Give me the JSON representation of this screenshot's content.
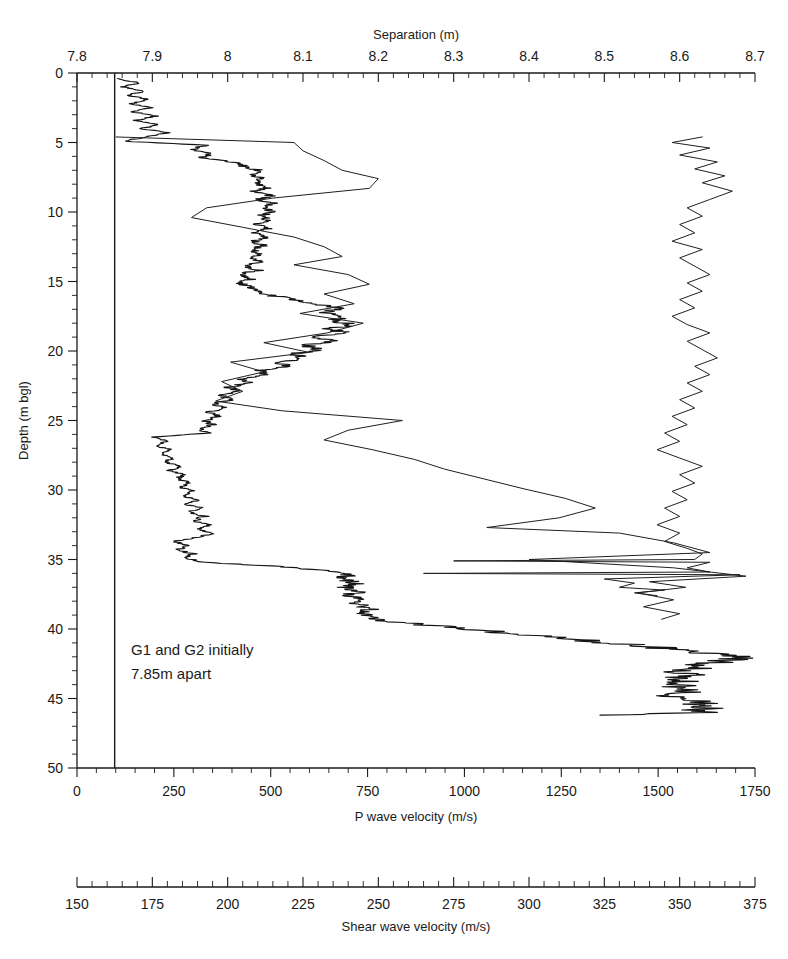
{
  "figure": {
    "background": "#ffffff",
    "ink": "#1a1a1a"
  },
  "annotation": {
    "line1": "G1 and G2 initially",
    "line2": "7.85m apart"
  },
  "chart_data": {
    "type": "line",
    "title": "",
    "orientation": "vertical-depth-profile",
    "grid": false,
    "legend": "none",
    "yaxis": {
      "label": "Depth (m bgl)",
      "min": 0,
      "max": 50,
      "inverted": true,
      "ticks": [
        0,
        5,
        10,
        15,
        20,
        25,
        30,
        35,
        40,
        45,
        50
      ],
      "tick_labels": [
        "0",
        "5",
        "10",
        "15",
        "20",
        "25",
        "30",
        "35",
        "40",
        "45",
        "50"
      ],
      "minor_interval": 1
    },
    "xaxis_top": {
      "label": "Separation (m)",
      "min": 7.8,
      "max": 8.7,
      "ticks": [
        7.8,
        7.9,
        8.0,
        8.1,
        8.2,
        8.3,
        8.4,
        8.5,
        8.6,
        8.7
      ],
      "tick_labels": [
        "7.8",
        "7.9",
        "8",
        "8.1",
        "8.2",
        "8.3",
        "8.4",
        "8.5",
        "8.6",
        "8.7"
      ],
      "minor_per_major": 5
    },
    "xaxis_bottom": {
      "label": "P wave velocity (m/s)",
      "min": 0,
      "max": 1750,
      "ticks": [
        0,
        250,
        500,
        750,
        1000,
        1250,
        1500,
        1750
      ],
      "tick_labels": [
        "0",
        "250",
        "500",
        "750",
        "1000",
        "1250",
        "1500",
        "1750"
      ],
      "minor_per_major": 5
    },
    "xaxis_shear": {
      "label": "Shear wave velocity (m/s)",
      "min": 150,
      "max": 375,
      "ticks": [
        150,
        175,
        200,
        225,
        250,
        275,
        300,
        325,
        350,
        375
      ],
      "tick_labels": [
        "150",
        "175",
        "200",
        "225",
        "250",
        "275",
        "300",
        "325",
        "350",
        "375"
      ],
      "minor_per_major": 5
    },
    "reference_line": {
      "name": "initial-separation",
      "axis": "xaxis_top",
      "value": 7.85,
      "depth_from": 0,
      "depth_to": 50
    },
    "series": [
      {
        "name": "P wave velocity",
        "axis": "xaxis_bottom",
        "style": "noisy",
        "points": [
          [
            0.4,
            105
          ],
          [
            0.7,
            160
          ],
          [
            1.0,
            120
          ],
          [
            1.3,
            175
          ],
          [
            1.6,
            130
          ],
          [
            1.9,
            185
          ],
          [
            2.2,
            140
          ],
          [
            2.5,
            190
          ],
          [
            2.8,
            145
          ],
          [
            3.1,
            205
          ],
          [
            3.4,
            150
          ],
          [
            3.7,
            215
          ],
          [
            4.0,
            165
          ],
          [
            4.3,
            235
          ],
          [
            4.6,
            180
          ],
          [
            4.9,
            120
          ],
          [
            5.2,
            330
          ],
          [
            5.5,
            300
          ],
          [
            5.8,
            345
          ],
          [
            6.1,
            320
          ],
          [
            6.4,
            400
          ],
          [
            6.7,
            430
          ],
          [
            7.0,
            470
          ],
          [
            7.3,
            445
          ],
          [
            7.6,
            480
          ],
          [
            7.9,
            455
          ],
          [
            8.2,
            495
          ],
          [
            8.5,
            460
          ],
          [
            8.8,
            500
          ],
          [
            9.1,
            470
          ],
          [
            9.4,
            510
          ],
          [
            9.7,
            475
          ],
          [
            10.0,
            505
          ],
          [
            10.3,
            470
          ],
          [
            10.6,
            500
          ],
          [
            10.9,
            460
          ],
          [
            11.2,
            495
          ],
          [
            11.5,
            455
          ],
          [
            11.8,
            490
          ],
          [
            12.1,
            450
          ],
          [
            12.4,
            485
          ],
          [
            12.7,
            445
          ],
          [
            13.0,
            480
          ],
          [
            13.3,
            440
          ],
          [
            13.6,
            470
          ],
          [
            13.9,
            430
          ],
          [
            14.2,
            465
          ],
          [
            14.5,
            425
          ],
          [
            14.8,
            455
          ],
          [
            15.1,
            415
          ],
          [
            15.4,
            450
          ],
          [
            15.7,
            470
          ],
          [
            16.0,
            500
          ],
          [
            16.3,
            560
          ],
          [
            16.6,
            610
          ],
          [
            16.9,
            680
          ],
          [
            17.2,
            640
          ],
          [
            17.5,
            700
          ],
          [
            17.8,
            660
          ],
          [
            18.1,
            710
          ],
          [
            18.4,
            655
          ],
          [
            18.7,
            690
          ],
          [
            19.0,
            620
          ],
          [
            19.3,
            660
          ],
          [
            19.6,
            590
          ],
          [
            19.9,
            630
          ],
          [
            20.2,
            560
          ],
          [
            20.5,
            590
          ],
          [
            20.8,
            520
          ],
          [
            21.1,
            545
          ],
          [
            21.4,
            470
          ],
          [
            21.7,
            495
          ],
          [
            22.0,
            420
          ],
          [
            22.3,
            445
          ],
          [
            22.6,
            390
          ],
          [
            22.9,
            415
          ],
          [
            23.2,
            370
          ],
          [
            23.5,
            395
          ],
          [
            23.8,
            355
          ],
          [
            24.1,
            380
          ],
          [
            24.4,
            340
          ],
          [
            24.7,
            365
          ],
          [
            25.0,
            330
          ],
          [
            25.3,
            350
          ],
          [
            25.6,
            315
          ],
          [
            25.9,
            340
          ],
          [
            26.2,
            200
          ],
          [
            26.5,
            230
          ],
          [
            26.8,
            205
          ],
          [
            27.1,
            240
          ],
          [
            27.4,
            215
          ],
          [
            27.7,
            250
          ],
          [
            28.0,
            225
          ],
          [
            28.3,
            265
          ],
          [
            28.6,
            240
          ],
          [
            28.9,
            280
          ],
          [
            29.2,
            255
          ],
          [
            29.5,
            295
          ],
          [
            29.8,
            265
          ],
          [
            30.1,
            300
          ],
          [
            30.4,
            275
          ],
          [
            30.7,
            310
          ],
          [
            31.0,
            280
          ],
          [
            31.3,
            320
          ],
          [
            31.6,
            290
          ],
          [
            31.9,
            330
          ],
          [
            32.2,
            300
          ],
          [
            32.5,
            340
          ],
          [
            32.8,
            310
          ],
          [
            33.1,
            350
          ],
          [
            33.4,
            315
          ],
          [
            33.7,
            250
          ],
          [
            34.0,
            285
          ],
          [
            34.3,
            260
          ],
          [
            34.6,
            300
          ],
          [
            34.9,
            275
          ],
          [
            35.2,
            330
          ],
          [
            35.5,
            520
          ],
          [
            35.8,
            640
          ],
          [
            36.1,
            700
          ],
          [
            36.4,
            680
          ],
          [
            36.7,
            720
          ],
          [
            37.0,
            690
          ],
          [
            37.3,
            730
          ],
          [
            37.6,
            700
          ],
          [
            37.9,
            745
          ],
          [
            38.2,
            715
          ],
          [
            38.5,
            760
          ],
          [
            38.8,
            735
          ],
          [
            39.1,
            770
          ],
          [
            39.4,
            790
          ],
          [
            39.7,
            900
          ],
          [
            40.0,
            1010
          ],
          [
            40.3,
            1120
          ],
          [
            40.6,
            1230
          ],
          [
            40.9,
            1340
          ],
          [
            41.2,
            1450
          ],
          [
            41.5,
            1560
          ],
          [
            41.8,
            1660
          ],
          [
            42.1,
            1710
          ],
          [
            42.4,
            1660
          ],
          [
            42.7,
            1600
          ],
          [
            43.0,
            1560
          ],
          [
            43.3,
            1590
          ],
          [
            43.6,
            1545
          ],
          [
            43.9,
            1580
          ],
          [
            44.2,
            1530
          ],
          [
            44.5,
            1575
          ],
          [
            44.8,
            1525
          ],
          [
            45.1,
            1570
          ],
          [
            45.4,
            1605
          ],
          [
            45.7,
            1630
          ],
          [
            46.0,
            1600
          ],
          [
            46.2,
            1350
          ]
        ]
      },
      {
        "name": "Shear wave velocity",
        "axis": "xaxis_shear",
        "style": "smooth",
        "points": [
          [
            4.6,
            163
          ],
          [
            5.0,
            222
          ],
          [
            5.6,
            225
          ],
          [
            6.3,
            232
          ],
          [
            7.0,
            238
          ],
          [
            7.6,
            250
          ],
          [
            8.3,
            247
          ],
          [
            9.0,
            215
          ],
          [
            9.7,
            193
          ],
          [
            10.4,
            188
          ],
          [
            11.1,
            205
          ],
          [
            11.8,
            222
          ],
          [
            12.5,
            232
          ],
          [
            13.2,
            238
          ],
          [
            13.8,
            222
          ],
          [
            14.5,
            240
          ],
          [
            15.2,
            247
          ],
          [
            15.9,
            232
          ],
          [
            16.6,
            242
          ],
          [
            17.3,
            224
          ],
          [
            18.0,
            245
          ],
          [
            18.7,
            233
          ],
          [
            19.4,
            212
          ],
          [
            20.1,
            227
          ],
          [
            20.8,
            201
          ],
          [
            21.5,
            212
          ],
          [
            22.2,
            198
          ],
          [
            22.9,
            205
          ],
          [
            23.6,
            196
          ],
          [
            24.3,
            218
          ],
          [
            25.0,
            258
          ],
          [
            25.7,
            240
          ],
          [
            26.4,
            232
          ],
          [
            27.1,
            248
          ],
          [
            27.8,
            262
          ],
          [
            28.5,
            272
          ],
          [
            29.2,
            285
          ],
          [
            29.9,
            298
          ],
          [
            30.6,
            312
          ],
          [
            31.3,
            322
          ],
          [
            32.0,
            310
          ],
          [
            32.7,
            286
          ],
          [
            33.1,
            330
          ],
          [
            33.8,
            348
          ],
          [
            34.5,
            360
          ],
          [
            35.0,
            300
          ],
          [
            35.6,
            348
          ],
          [
            36.2,
            372
          ],
          [
            36.6,
            340
          ],
          [
            37.0,
            352
          ],
          [
            37.4,
            336
          ],
          [
            37.9,
            348
          ],
          [
            38.4,
            338
          ],
          [
            38.9,
            350
          ],
          [
            39.3,
            344
          ]
        ]
      },
      {
        "name": "Separation",
        "axis": "xaxis_top",
        "style": "smooth",
        "points": [
          [
            4.6,
            8.63
          ],
          [
            5.0,
            8.59
          ],
          [
            5.4,
            8.64
          ],
          [
            5.9,
            8.6
          ],
          [
            6.4,
            8.65
          ],
          [
            6.9,
            8.62
          ],
          [
            7.4,
            8.66
          ],
          [
            7.9,
            8.63
          ],
          [
            8.5,
            8.67
          ],
          [
            9.1,
            8.64
          ],
          [
            9.7,
            8.61
          ],
          [
            10.3,
            8.63
          ],
          [
            10.9,
            8.6
          ],
          [
            11.5,
            8.62
          ],
          [
            12.1,
            8.59
          ],
          [
            12.7,
            8.63
          ],
          [
            13.3,
            8.6
          ],
          [
            13.9,
            8.62
          ],
          [
            14.5,
            8.64
          ],
          [
            15.1,
            8.61
          ],
          [
            15.7,
            8.63
          ],
          [
            16.3,
            8.6
          ],
          [
            16.9,
            8.62
          ],
          [
            17.5,
            8.59
          ],
          [
            18.1,
            8.61
          ],
          [
            18.7,
            8.64
          ],
          [
            19.3,
            8.61
          ],
          [
            19.9,
            8.63
          ],
          [
            20.5,
            8.65
          ],
          [
            21.1,
            8.62
          ],
          [
            21.7,
            8.64
          ],
          [
            22.3,
            8.61
          ],
          [
            22.9,
            8.63
          ],
          [
            23.5,
            8.6
          ],
          [
            24.1,
            8.62
          ],
          [
            24.7,
            8.59
          ],
          [
            25.3,
            8.61
          ],
          [
            25.9,
            8.58
          ],
          [
            26.5,
            8.6
          ],
          [
            27.1,
            8.57
          ],
          [
            27.7,
            8.6
          ],
          [
            28.3,
            8.63
          ],
          [
            28.9,
            8.6
          ],
          [
            29.5,
            8.62
          ],
          [
            30.1,
            8.59
          ],
          [
            30.7,
            8.61
          ],
          [
            31.3,
            8.58
          ],
          [
            31.9,
            8.6
          ],
          [
            32.5,
            8.57
          ],
          [
            33.1,
            8.6
          ],
          [
            33.7,
            8.58
          ],
          [
            34.2,
            8.61
          ],
          [
            34.6,
            8.63
          ],
          [
            35.0,
            8.62
          ],
          [
            35.1,
            8.3
          ],
          [
            35.2,
            8.64
          ],
          [
            35.6,
            8.61
          ],
          [
            35.9,
            8.64
          ],
          [
            36.0,
            8.26
          ],
          [
            36.1,
            8.68
          ],
          [
            36.4,
            8.5
          ],
          [
            36.7,
            8.54
          ],
          [
            37.0,
            8.52
          ],
          [
            37.2,
            8.58
          ],
          [
            37.4,
            8.54
          ],
          [
            37.6,
            8.57
          ]
        ]
      }
    ]
  }
}
